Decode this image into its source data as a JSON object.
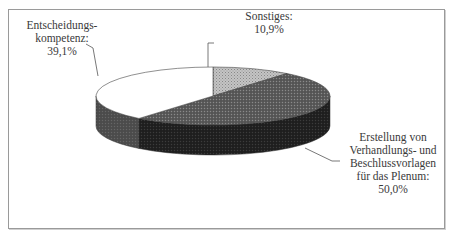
{
  "chart_data": {
    "type": "pie",
    "style": "3d",
    "title": "",
    "slices": [
      {
        "label_lines": [
          "Sonstiges:",
          "10,9%"
        ],
        "name": "Sonstiges",
        "value": 10.9,
        "value_text": "10,9%",
        "fill": "#b8b8b8",
        "side": "#8a8a8a",
        "pattern": "light-dots"
      },
      {
        "label_lines": [
          "Erstellung von",
          "Verhandlungs- und",
          "Beschlussvorlagen",
          "für das Plenum:",
          "50,0%"
        ],
        "name": "Erstellung von Verhandlungs- und Beschlussvorlagen für das Plenum",
        "value": 50.0,
        "value_text": "50,0%",
        "fill": "#5a5a5a",
        "side": "#262626",
        "pattern": "dark-dots"
      },
      {
        "label_lines": [
          "Entscheidungs-",
          "kompetenz:",
          "39,1%"
        ],
        "name": "Entscheidungskompetenz",
        "value": 39.1,
        "value_text": "39,1%",
        "fill": "#ffffff",
        "side": "#505050",
        "pattern": "none"
      }
    ],
    "start_angle": "12 o'clock",
    "direction": "clockwise",
    "legend": "none",
    "data_labels": "outside with leader lines"
  }
}
